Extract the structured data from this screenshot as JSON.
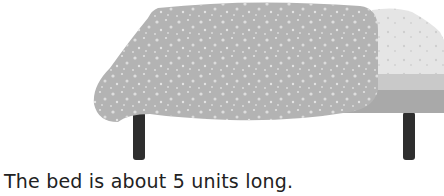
{
  "image": {
    "subject": "bed",
    "elements": [
      "blanket",
      "pillow",
      "mattress",
      "bed-frame",
      "legs"
    ]
  },
  "caption": "The bed is about 5 units long.",
  "colors": {
    "blanket": "#b4b4b4",
    "blanket_spots": "#e0e0e0",
    "pillow": "#e4e4e4",
    "mattress": "#c8c8c8",
    "frame": "#a8a8a8",
    "legs": "#2e2e2e"
  }
}
